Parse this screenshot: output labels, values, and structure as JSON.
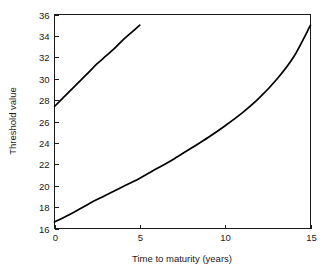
{
  "chart_data": {
    "type": "line",
    "title": "",
    "xlabel": "Time to maturity (years)",
    "ylabel": "Threshold value",
    "xlim": [
      0,
      15
    ],
    "ylim": [
      16,
      36
    ],
    "xticks": [
      0,
      5,
      10,
      15
    ],
    "yticks": [
      16,
      18,
      20,
      22,
      24,
      26,
      28,
      30,
      32,
      34,
      36
    ],
    "xtick_labels": [
      "0",
      "5",
      "10",
      "15"
    ],
    "ytick_labels": [
      "16",
      "18",
      "20",
      "22",
      "24",
      "26",
      "28",
      "30",
      "32",
      "34",
      "36"
    ],
    "grid": false,
    "legend": null,
    "legend_position": "none",
    "series": [
      {
        "name": "upper-curve",
        "x": [
          0,
          0.5,
          1,
          1.5,
          2,
          2.5,
          3,
          3.5,
          4,
          4.5,
          5
        ],
        "values": [
          27.4,
          28.2,
          29.0,
          29.8,
          30.6,
          31.4,
          32.1,
          32.8,
          33.6,
          34.3,
          35.0
        ],
        "color": "#000000"
      },
      {
        "name": "lower-curve",
        "x": [
          0,
          1,
          2,
          3,
          4,
          5,
          6,
          7,
          8,
          9,
          10,
          11,
          12,
          13,
          14,
          15
        ],
        "values": [
          16.6,
          17.4,
          18.3,
          19.1,
          19.9,
          20.7,
          21.6,
          22.5,
          23.5,
          24.5,
          25.6,
          26.8,
          28.2,
          29.9,
          32.0,
          35.0
        ],
        "color": "#000000"
      }
    ],
    "axis_color": "#1a1a1a",
    "background_color": "#ffffff"
  }
}
